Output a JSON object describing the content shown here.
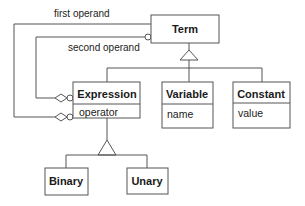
{
  "diagram": {
    "type": "UML class diagram",
    "classes": {
      "term": {
        "name": "Term"
      },
      "expression": {
        "name": "Expression",
        "attributes": [
          "operator"
        ]
      },
      "variable": {
        "name": "Variable",
        "attributes": [
          "name"
        ]
      },
      "constant": {
        "name": "Constant",
        "attributes": [
          "value"
        ]
      },
      "binary": {
        "name": "Binary"
      },
      "unary": {
        "name": "Unary"
      }
    },
    "associations": [
      {
        "label": "first operand",
        "from": "Expression",
        "to": "Term",
        "source_end": "aggregation-diamond",
        "target_end": "none"
      },
      {
        "label": "second operand",
        "from": "Expression",
        "to": "Term",
        "source_end": "aggregation-diamond",
        "target_end": "optional-circle"
      }
    ],
    "generalizations": [
      {
        "parent": "Term",
        "children": [
          "Expression",
          "Variable",
          "Constant"
        ]
      },
      {
        "parent": "Expression",
        "children": [
          "Binary",
          "Unary"
        ]
      }
    ],
    "labels": {
      "first_operand": "first operand",
      "second_operand": "second operand"
    }
  }
}
